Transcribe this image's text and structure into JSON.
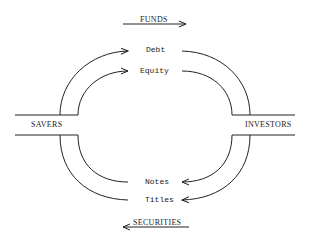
{
  "diagram": {
    "top_flow_label": "FUNDS",
    "bottom_flow_label": "SECURITIES",
    "left_node": "SAVERS",
    "right_node": "INVESTORS",
    "top_items": [
      "Debt",
      "Equity"
    ],
    "bottom_items": [
      "Notes",
      "Titles"
    ]
  },
  "colors": {
    "line": "#222222",
    "background": "#ffffff"
  }
}
